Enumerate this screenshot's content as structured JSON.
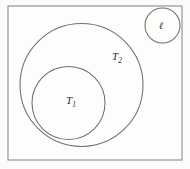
{
  "figure": {
    "width": 190,
    "height": 169,
    "background_color": "#fbfbf9",
    "stroke_color": "#6f6f6f",
    "frame_stroke_color": "#8c8c8c",
    "label_color": "#2b2b2b"
  },
  "frame": {
    "name": "universe-rectangle",
    "x": 8,
    "y": 6,
    "width": 174,
    "height": 154
  },
  "chart_data": {
    "type": "diagram",
    "title": "",
    "shapes": [
      {
        "id": "T2",
        "kind": "circle",
        "label": "T",
        "subscript": "2",
        "cx": 81.5,
        "cy": 85,
        "r": 61.5,
        "label_x": 112,
        "label_y": 60,
        "fill": "none"
      },
      {
        "id": "T1",
        "kind": "circle",
        "label": "T",
        "subscript": "1",
        "cx": 68.5,
        "cy": 103,
        "r": 36.5,
        "label_x": 66,
        "label_y": 104,
        "fill": "none"
      },
      {
        "id": "ell",
        "kind": "circle",
        "label": "ℓ",
        "subscript": "",
        "cx": 162.5,
        "cy": 25.5,
        "r": 17.5,
        "label_x": 161,
        "label_y": 29,
        "fill": "none"
      }
    ],
    "relations": [
      "T1 is contained in T2",
      "ell circle is disjoint from T1 and T2",
      "all circles are inside the universe rectangle"
    ]
  }
}
